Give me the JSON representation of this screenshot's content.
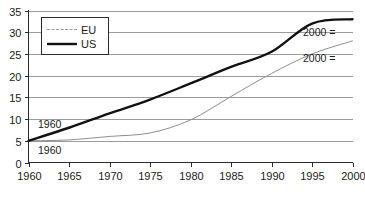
{
  "chart_data": {
    "type": "line",
    "title": "",
    "subtitle": "",
    "xlabel": "",
    "ylabel": "",
    "xlim": [
      1960,
      2000
    ],
    "ylim": [
      0,
      35
    ],
    "grid": true,
    "legend_position": "top-left",
    "x_ticks": [
      "1960",
      "1965",
      "1970",
      "1975",
      "1980",
      "1985",
      "1990",
      "1995",
      "2000"
    ],
    "y_ticks": [
      "0",
      "5",
      "10",
      "15",
      "20",
      "25",
      "30",
      "35"
    ],
    "x": [
      1960,
      1965,
      1970,
      1975,
      1980,
      1985,
      1990,
      1995,
      2000
    ],
    "series": [
      {
        "name": "EU",
        "style": "thin-grey",
        "values": [
          5,
          5.2,
          6,
          6.8,
          9.8,
          15.2,
          20.5,
          25,
          28
        ]
      },
      {
        "name": "US",
        "style": "thick-black",
        "values": [
          5,
          8,
          11.3,
          14.5,
          18.2,
          22,
          25.5,
          32,
          33
        ]
      }
    ],
    "annotations": [
      {
        "id": "us-start",
        "text": "1960",
        "x_px": 38,
        "y_px": 128,
        "series": "US"
      },
      {
        "id": "eu-start",
        "text": "1960",
        "x_px": 38,
        "y_px": 154,
        "series": "EU"
      },
      {
        "id": "us-end",
        "text": "2000 =",
        "x_px": 303,
        "y_px": 36,
        "series": "US"
      },
      {
        "id": "eu-end",
        "text": "2000 =",
        "x_px": 303,
        "y_px": 62,
        "series": "EU"
      }
    ],
    "legend": [
      {
        "label": "EU",
        "style": "thin-grey"
      },
      {
        "label": "US",
        "style": "thick-black"
      }
    ],
    "colors": {
      "us_line": "#111111",
      "eu_line": "#8e8e8e",
      "gridline": "#9b9b9b",
      "axis": "#2b2b2b",
      "background": "#ffffff",
      "text": "#1a1a1a"
    }
  }
}
